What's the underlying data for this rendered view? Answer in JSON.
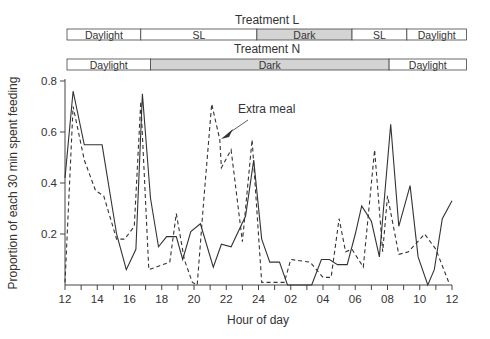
{
  "chart_data": {
    "type": "line",
    "title": "",
    "xlabel": "Hour of day",
    "ylabel": "Proportion of each 30 min spent feeding",
    "ylim": [
      0,
      0.8
    ],
    "xlim_hours": [
      12,
      36
    ],
    "x_tick_labels": [
      "12",
      "14",
      "16",
      "18",
      "20",
      "22",
      "24",
      "02",
      "04",
      "06",
      "08",
      "10",
      "12"
    ],
    "y_tick_labels": [
      "0.2",
      "0.4",
      "0.6",
      "0.8"
    ],
    "y_ticks": [
      0.2,
      0.4,
      0.6,
      0.8
    ],
    "grid": false,
    "legend": [],
    "annotations": [
      {
        "text": "Extra meal",
        "x_hour": 21.7,
        "y": 0.57,
        "arrow": true
      }
    ],
    "series": [
      {
        "name": "Treatment L",
        "style": "solid",
        "x": [
          12.0,
          12.5,
          13.2,
          14.3,
          15.2,
          15.8,
          16.4,
          16.8,
          17.3,
          17.8,
          18.3,
          18.9,
          19.3,
          19.8,
          20.4,
          21.2,
          21.7,
          22.3,
          23.2,
          23.7,
          24.2,
          24.7,
          25.3,
          25.8,
          27.3,
          27.9,
          28.4,
          28.9,
          29.5,
          30.0,
          30.4,
          31.0,
          31.5,
          32.2,
          32.7,
          33.4,
          33.9,
          34.5,
          34.9,
          35.4,
          36.0
        ],
        "values": [
          0.42,
          0.76,
          0.55,
          0.55,
          0.2,
          0.06,
          0.14,
          0.75,
          0.34,
          0.15,
          0.19,
          0.19,
          0.1,
          0.21,
          0.24,
          0.07,
          0.16,
          0.15,
          0.27,
          0.49,
          0.18,
          0.09,
          0.09,
          0.0,
          0.0,
          0.1,
          0.1,
          0.08,
          0.08,
          0.2,
          0.31,
          0.25,
          0.11,
          0.63,
          0.23,
          0.39,
          0.11,
          0.0,
          0.06,
          0.26,
          0.33
        ]
      },
      {
        "name": "Treatment N",
        "style": "dashed",
        "x": [
          12.0,
          12.5,
          13.2,
          13.9,
          14.4,
          15.2,
          15.7,
          16.3,
          16.7,
          17.2,
          18.5,
          18.9,
          19.4,
          19.9,
          20.2,
          20.6,
          21.1,
          21.6,
          21.7,
          22.3,
          23.0,
          23.6,
          24.2,
          24.6,
          25.6,
          26.0,
          27.2,
          28.0,
          28.5,
          29.0,
          29.4,
          29.8,
          30.5,
          31.2,
          31.7,
          32.0,
          32.7,
          33.3,
          34.3,
          35.0,
          35.8
        ],
        "values": [
          0.01,
          0.7,
          0.49,
          0.37,
          0.35,
          0.18,
          0.18,
          0.23,
          0.72,
          0.06,
          0.09,
          0.28,
          0.1,
          0.01,
          0.0,
          0.33,
          0.71,
          0.57,
          0.46,
          0.53,
          0.17,
          0.57,
          0.01,
          0.01,
          0.01,
          0.1,
          0.09,
          0.03,
          0.03,
          0.26,
          0.13,
          0.14,
          0.07,
          0.53,
          0.13,
          0.35,
          0.12,
          0.13,
          0.2,
          0.14,
          0.01
        ]
      }
    ],
    "bands": [
      {
        "title": "Treatment L",
        "segments": [
          {
            "label": "Daylight",
            "start": 12.1,
            "end": 16.7,
            "shaded": false
          },
          {
            "label": "SL",
            "start": 16.7,
            "end": 23.9,
            "shaded": false
          },
          {
            "label": "Dark",
            "start": 23.9,
            "end": 29.8,
            "shaded": true
          },
          {
            "label": "SL",
            "start": 29.8,
            "end": 33.2,
            "shaded": false
          },
          {
            "label": "Daylight",
            "start": 33.2,
            "end": 36.9,
            "shaded": false
          }
        ]
      },
      {
        "title": "Treatment N",
        "segments": [
          {
            "label": "Daylight",
            "start": 12.1,
            "end": 17.3,
            "shaded": false
          },
          {
            "label": "Dark",
            "start": 17.3,
            "end": 32.1,
            "shaded": true
          },
          {
            "label": "Daylight",
            "start": 32.1,
            "end": 36.9,
            "shaded": false
          }
        ]
      }
    ]
  },
  "colors": {
    "line": "#333333",
    "band_shade": "#d4d4d4",
    "band_border": "#444444",
    "axis": "#444444"
  }
}
